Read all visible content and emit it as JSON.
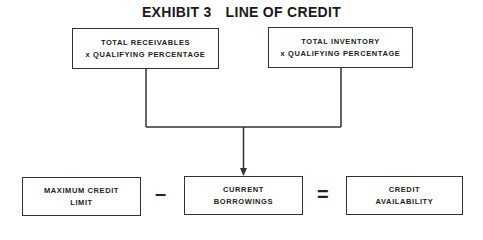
{
  "title": {
    "exhibit": "EXHIBIT 3",
    "name": "LINE OF CREDIT"
  },
  "top_boxes": [
    {
      "lines": [
        "TOTAL RECEIVABLES",
        "x QUALIFYING PERCENTAGE"
      ]
    },
    {
      "lines": [
        "TOTAL INVENTORY",
        "x QUALIFYING PERCENTAGE"
      ]
    }
  ],
  "bottom_boxes": [
    {
      "lines": [
        "MAXIMUM CREDIT",
        "LIMIT"
      ]
    },
    {
      "lines": [
        "CURRENT",
        "BORROWINGS"
      ]
    },
    {
      "lines": [
        "CREDIT",
        "AVAILABILITY"
      ]
    }
  ],
  "operators": {
    "minus": "–",
    "equals": "="
  },
  "colors": {
    "stroke": "#333333",
    "text": "#222222",
    "background": "#ffffff"
  }
}
